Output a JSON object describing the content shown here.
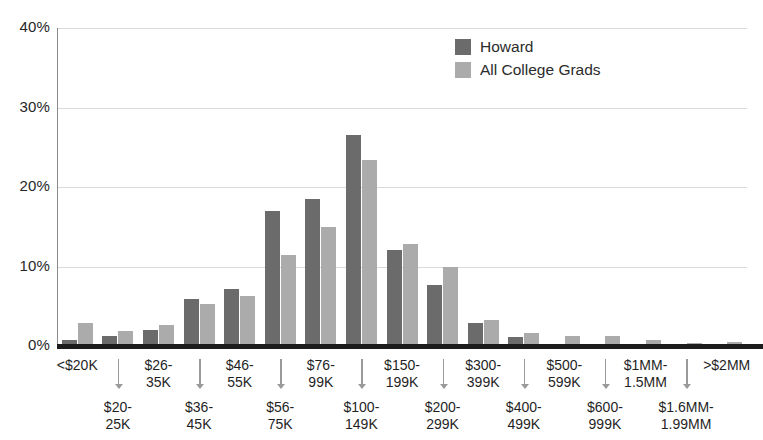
{
  "chart_data": {
    "type": "bar",
    "title": "",
    "xlabel": "",
    "ylabel": "",
    "ylim": [
      0,
      40
    ],
    "yticks": [
      "0%",
      "10%",
      "20%",
      "30%",
      "40%"
    ],
    "ytick_values": [
      0,
      10,
      20,
      30,
      40
    ],
    "grid": true,
    "legend_position": "top-center",
    "categories": [
      "<$20K",
      "$20-\n25K",
      "$26-\n35K",
      "$36-\n45K",
      "$46-\n55K",
      "$56-\n75K",
      "$76-\n99K",
      "$100-\n149K",
      "$150-\n199K",
      "$200-\n299K",
      "$300-\n399K",
      "$400-\n499K",
      "$500-\n599K",
      "$600-\n999K",
      "$1MM-\n1.5MM",
      "$1.6MM-\n1.99MM",
      ">$2MM"
    ],
    "series": [
      {
        "name": "Howard",
        "color": "#6b6b6b",
        "values": [
          0.8,
          1.3,
          2.0,
          5.9,
          7.2,
          17.0,
          18.5,
          26.5,
          12.1,
          7.7,
          2.9,
          1.1,
          0.3,
          0.2,
          0.3,
          0.1,
          0.2
        ]
      },
      {
        "name": "All College Grads",
        "color": "#ababab",
        "values": [
          2.9,
          1.9,
          2.6,
          5.3,
          6.3,
          11.5,
          15.0,
          23.4,
          12.8,
          9.9,
          3.3,
          1.6,
          1.2,
          1.2,
          0.8,
          0.4,
          0.5
        ]
      }
    ]
  },
  "legend": {
    "items": [
      {
        "label": "Howard",
        "color": "#6b6b6b"
      },
      {
        "label": "All College Grads",
        "color": "#ababab"
      }
    ]
  },
  "axis": {
    "y": {
      "ticks": [
        "40%",
        "30%",
        "20%",
        "10%",
        "0%"
      ]
    }
  },
  "colors": {
    "howard": "#6b6b6b",
    "all_college_grads": "#ababab",
    "gridline": "#d9d9d9",
    "axis": "#1c1c1c",
    "background": "#ffffff"
  }
}
